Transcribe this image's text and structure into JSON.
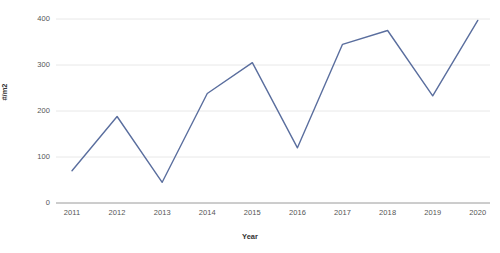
{
  "chart_data": {
    "type": "line",
    "title": "",
    "subtitle": "",
    "xlabel": "Year",
    "ylabel": "#/m2",
    "categories": [
      "2011",
      "2012",
      "2013",
      "2014",
      "2015",
      "2016",
      "2017",
      "2018",
      "2019",
      "2020"
    ],
    "values": [
      70,
      188,
      45,
      238,
      305,
      120,
      345,
      375,
      233,
      397
    ],
    "series": [
      {
        "name": "",
        "values": [
          70,
          188,
          45,
          238,
          305,
          120,
          345,
          375,
          233,
          397
        ],
        "color": "#5a6e9e"
      }
    ],
    "ylim": [
      0,
      400
    ],
    "xlim": [
      "2011",
      "2020"
    ],
    "y_ticks": [
      0,
      100,
      200,
      300,
      400
    ],
    "y_tick_labels": [
      "0",
      "100",
      "200",
      "300",
      "400"
    ],
    "x_tick_labels": [
      "2011",
      "2012",
      "2013",
      "2014",
      "2015",
      "2016",
      "2017",
      "2018",
      "2019",
      "2020"
    ],
    "grid": true,
    "grid_axis": "y",
    "grid_color": "#e8e8e8",
    "legend": false,
    "legend_position": "none",
    "background_color": "#ffffff",
    "line_color": "#5a6e9e",
    "line_width": 1.4,
    "markers": false,
    "annotations": []
  },
  "axes": {
    "y_title": "#/m2",
    "x_title": "Year"
  }
}
